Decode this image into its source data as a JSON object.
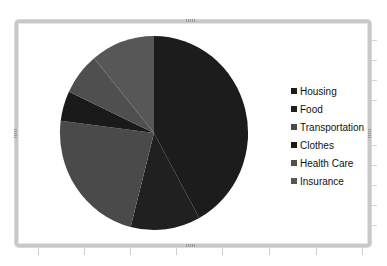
{
  "chart_data": {
    "type": "pie",
    "title": "",
    "categories": [
      "Housing",
      "Food",
      "Transportation",
      "Clothes",
      "Health Care",
      "Insurance"
    ],
    "values": [
      42,
      12,
      23,
      5,
      7,
      11
    ],
    "unit": "percent (estimated from slice angles)",
    "colors": [
      "#1c1c1c",
      "#202020",
      "#4a4a4a",
      "#1a1a1a",
      "#4f4f4f",
      "#575757"
    ],
    "start_angle_deg": 0,
    "direction": "clockwise",
    "legend_position": "right"
  },
  "legend": {
    "items": [
      {
        "label": "Housing",
        "color": "#1c1c1c"
      },
      {
        "label": "Food",
        "color": "#202020"
      },
      {
        "label": "Transportation",
        "color": "#4a4a4a"
      },
      {
        "label": "Clothes",
        "color": "#1a1a1a"
      },
      {
        "label": "Health Care",
        "color": "#4f4f4f"
      },
      {
        "label": "Insurance",
        "color": "#575757"
      }
    ]
  }
}
